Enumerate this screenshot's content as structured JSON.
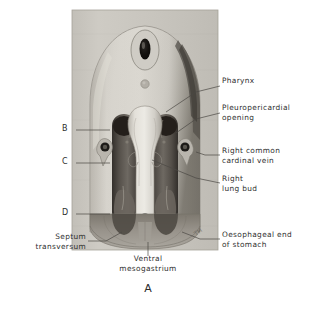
{
  "figure": {
    "letter": "A",
    "plate": {
      "x": 72,
      "y": 10,
      "width": 146,
      "height": 240
    }
  },
  "markers": [
    {
      "id": "B",
      "label": "B",
      "x": 62,
      "y": 126,
      "line_x1": 76,
      "line_x2": 110,
      "line_y": 130
    },
    {
      "id": "C",
      "label": "C",
      "x": 62,
      "y": 159,
      "line_x1": 76,
      "line_x2": 110,
      "line_y": 163
    },
    {
      "id": "D",
      "label": "D",
      "x": 62,
      "y": 210,
      "line_x1": 76,
      "line_x2": 110,
      "line_y": 214
    }
  ],
  "annotations": [
    {
      "id": "pharynx",
      "text": "Pharynx",
      "x": 222,
      "y": 80,
      "align": "right",
      "leader": [
        [
          220,
          86
        ],
        [
          196,
          92
        ],
        [
          166,
          112
        ]
      ]
    },
    {
      "id": "pleuropericardial-opening",
      "text": "Pleuropericardial\nopening",
      "x": 222,
      "y": 107,
      "align": "right",
      "leader": [
        [
          220,
          113
        ],
        [
          196,
          119
        ],
        [
          176,
          133
        ]
      ]
    },
    {
      "id": "right-common-cardinal-vein",
      "text": "Right common\ncardinal vein",
      "x": 222,
      "y": 150,
      "align": "right",
      "leader": [
        [
          220,
          155
        ],
        [
          205,
          155
        ],
        [
          196,
          152
        ]
      ]
    },
    {
      "id": "right-lung-bud",
      "text": "Right\nlung bud",
      "x": 222,
      "y": 178,
      "align": "right",
      "leader": [
        [
          220,
          183
        ],
        [
          196,
          178
        ],
        [
          152,
          160
        ]
      ]
    },
    {
      "id": "oesophageal-end-of-stomach",
      "text": "Oesophageal end\nof stomach",
      "x": 222,
      "y": 234,
      "align": "right",
      "leader": [
        [
          220,
          239
        ],
        [
          200,
          239
        ],
        [
          182,
          232
        ]
      ]
    },
    {
      "id": "septum-transversum",
      "text": "Septum\ntransversum",
      "x": 86,
      "y": 236,
      "align": "rightalign",
      "leader": [
        [
          88,
          241
        ],
        [
          106,
          241
        ],
        [
          122,
          232
        ]
      ]
    },
    {
      "id": "ventral-mesogastrium",
      "text": "Ventral\nmesogastrium",
      "x": 145,
      "y": 258,
      "align": "center",
      "leader": [
        [
          148,
          256
        ],
        [
          148,
          242
        ]
      ]
    }
  ],
  "colors": {
    "plate_background": "#c9c6bf",
    "plate_border": "#9a968e",
    "body_wall_light": "#d4d1ca",
    "body_wall_mid": "#b8b4ac",
    "canal_dark": "#4a4540",
    "canal_darkest": "#2e2b27",
    "pharynx_light": "#dedbd3",
    "septum_mid": "#8d887f",
    "vessel_ring": "#1f1d1a",
    "leader_line": "#4a4744",
    "page_background": "#ffffff"
  },
  "monogram": "TH"
}
